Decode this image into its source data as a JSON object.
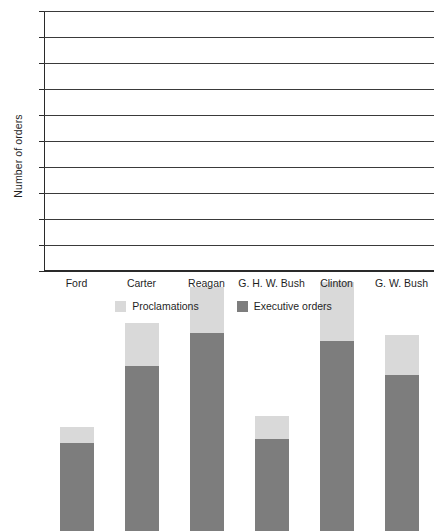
{
  "chart_data": {
    "type": "bar",
    "subtype": "stacked-vertical",
    "title": "",
    "xlabel": "",
    "ylabel": "Number of orders",
    "ylim": [
      0,
      500
    ],
    "ytick_step": 50,
    "yticks": [
      0,
      50,
      100,
      150,
      200,
      250,
      300,
      350,
      400,
      450,
      500
    ],
    "ytick_labels": [
      "0",
      "50",
      "100",
      "150",
      "200",
      "250",
      "300",
      "350",
      "400",
      "450",
      "500"
    ],
    "grid": true,
    "grid_axis": "y",
    "legend_position": "bottom",
    "categories": [
      "Ford",
      "Carter",
      "Reagan",
      "G. H. W. Bush",
      "Clinton",
      "G. W. Bush"
    ],
    "series": [
      {
        "name": "Executive orders",
        "color": "#7d7d7d",
        "values": [
          170,
          318,
          381,
          177,
          366,
          300
        ]
      },
      {
        "name": "Proclamations",
        "color": "#d9d9d9",
        "values": [
          30,
          82,
          89,
          45,
          112,
          77
        ]
      }
    ],
    "stack_order": [
      "Executive orders",
      "Proclamations"
    ],
    "totals": [
      200,
      400,
      470,
      222,
      478,
      377
    ]
  },
  "legend": {
    "items": [
      {
        "label": "Proclamations",
        "color": "#d9d9d9"
      },
      {
        "label": "Executive orders",
        "color": "#7d7d7d"
      }
    ]
  },
  "axis": {
    "y_title": "Number of orders"
  }
}
